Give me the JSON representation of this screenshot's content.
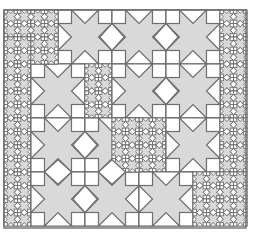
{
  "figure": {
    "colors": {
      "star": "#d9d9d9",
      "tile": "#ffffff",
      "stroke": "#6e6e6e",
      "background": "#ffffff"
    },
    "bounds": {
      "x": 4,
      "y": 10,
      "w": 242,
      "h": 218
    },
    "regions": [
      {
        "x": 4,
        "y": 10,
        "size": 13.5,
        "cols": 4,
        "rows": 2
      },
      {
        "x": 58,
        "y": 10,
        "size": 54,
        "cols": 3,
        "rows": 1
      },
      {
        "x": 220,
        "y": 10,
        "size": 13.5,
        "cols": 2,
        "rows": 8
      },
      {
        "x": 4,
        "y": 37,
        "size": 13.5,
        "cols": 2,
        "rows": 14
      },
      {
        "x": 31,
        "y": 64,
        "size": 54,
        "cols": 1,
        "rows": 1
      },
      {
        "x": 85,
        "y": 64,
        "size": 13.5,
        "cols": 2,
        "rows": 4
      },
      {
        "x": 112,
        "y": 64,
        "size": 54,
        "cols": 2,
        "rows": 1
      },
      {
        "x": 31,
        "y": 10,
        "size": 13.5,
        "cols": 2,
        "rows": 4
      },
      {
        "x": 31,
        "y": 118,
        "size": 54,
        "cols": 2,
        "rows": 2
      },
      {
        "x": 139,
        "y": 118,
        "size": 13.5,
        "cols": 2,
        "rows": 4
      },
      {
        "x": 166,
        "y": 118,
        "size": 54,
        "cols": 1,
        "rows": 1
      },
      {
        "x": 220,
        "y": 118,
        "size": 13.5,
        "cols": 2,
        "rows": 4
      },
      {
        "x": 139,
        "y": 172,
        "size": 54,
        "cols": 1,
        "rows": 1
      },
      {
        "x": 193,
        "y": 172,
        "size": 13.5,
        "cols": 4,
        "rows": 4
      },
      {
        "x": 112,
        "y": 118,
        "size": 13.5,
        "cols": 2,
        "rows": 4
      },
      {
        "x": 85,
        "y": 118,
        "size": 13.5,
        "cols": 2,
        "rows": 0
      }
    ]
  }
}
